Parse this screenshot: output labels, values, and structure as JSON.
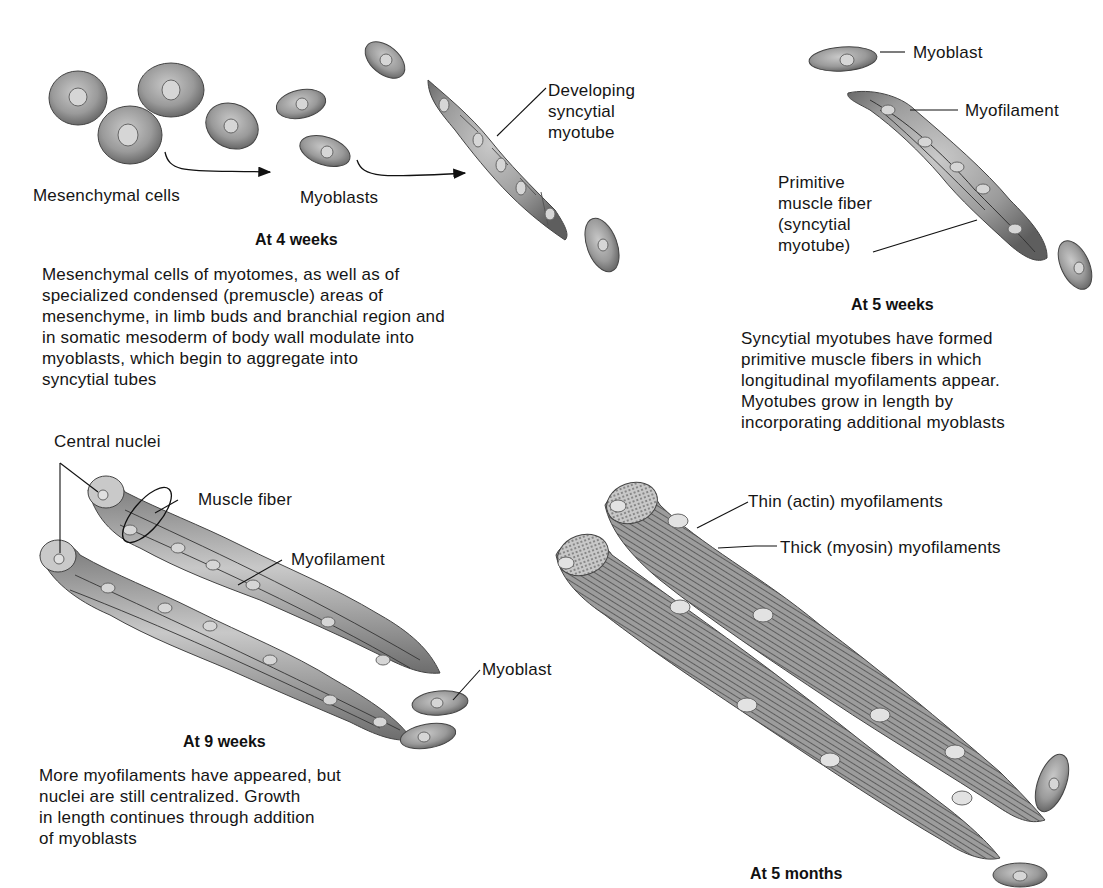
{
  "figure": {
    "panels": [
      {
        "id": "4-weeks",
        "title": "At 4 weeks",
        "labels": {
          "mesenchymal": "Mesenchymal cells",
          "myoblasts": "Myoblasts",
          "myotube": "Developing\nsyncytial\nmyotube"
        },
        "description": "Mesenchymal cells of myotomes, as well as of\nspecialized condensed (premuscle) areas of\nmesenchyme, in limb buds and branchial region and\nin somatic mesoderm of body wall modulate into\nmyoblasts, which begin to aggregate into\nsyncytial tubes"
      },
      {
        "id": "5-weeks",
        "title": "At 5 weeks",
        "labels": {
          "myoblast": "Myoblast",
          "myofilament": "Myofilament",
          "primitive_fiber": "Primitive\nmuscle fiber\n(syncytial\nmyotube)"
        },
        "description": "Syncytial myotubes have formed\nprimitive muscle fibers in which\nlongitudinal myofilaments appear.\nMyotubes grow in length by\nincorporating additional myoblasts"
      },
      {
        "id": "9-weeks",
        "title": "At 9 weeks",
        "labels": {
          "central_nuclei": "Central nuclei",
          "muscle_fiber": "Muscle fiber",
          "myofilament": "Myofilament",
          "myoblast": "Myoblast"
        },
        "description": "More myofilaments have appeared, but\nnuclei are still centralized. Growth\nin length continues through addition\nof myoblasts"
      },
      {
        "id": "5-months",
        "title": "At 5 months",
        "labels": {
          "thin": "Thin (actin) myofilaments",
          "thick": "Thick (myosin) myofilaments"
        }
      }
    ]
  },
  "colors": {
    "cell_fill": "#9a9a9a",
    "cell_dark": "#5e5e5e",
    "nucleus": "#d4d4d4",
    "fiber_fill": "#a8a8a8",
    "striation": "#3a3a3a",
    "text": "#151515"
  }
}
